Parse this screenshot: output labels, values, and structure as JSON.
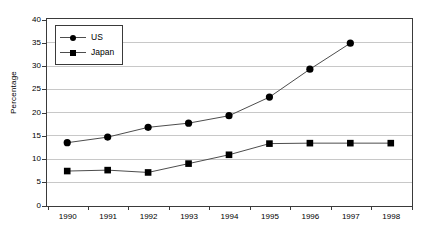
{
  "chart_data": {
    "type": "line",
    "title": "",
    "xlabel": "",
    "ylabel": "Percentage",
    "categories": [
      "1990",
      "1991",
      "1992",
      "1993",
      "1994",
      "1995",
      "1996",
      "1997",
      "1998"
    ],
    "ylim": [
      0,
      40
    ],
    "yticks": [
      0,
      5,
      10,
      15,
      20,
      25,
      30,
      35,
      40
    ],
    "ytick_labels": [
      "0",
      "5",
      "10",
      "15",
      "20",
      "25",
      "30",
      "35",
      "40"
    ],
    "grid": "horizontal",
    "legend_position": "top-left",
    "series": [
      {
        "name": "US",
        "marker": "circle",
        "color": "#000000",
        "x": [
          "1990",
          "1991",
          "1992",
          "1993",
          "1994",
          "1995",
          "1996",
          "1997"
        ],
        "values": [
          13.4,
          14.6,
          16.7,
          17.6,
          19.2,
          23.2,
          29.2,
          34.8
        ]
      },
      {
        "name": "Japan",
        "marker": "square",
        "color": "#000000",
        "x": [
          "1990",
          "1991",
          "1992",
          "1993",
          "1994",
          "1995",
          "1996",
          "1997",
          "1998"
        ],
        "values": [
          7.3,
          7.5,
          7.0,
          8.9,
          10.8,
          13.2,
          13.3,
          13.3,
          13.3
        ]
      }
    ]
  },
  "legend": {
    "items": [
      {
        "label": "US",
        "marker": "circle"
      },
      {
        "label": "Japan",
        "marker": "square"
      }
    ]
  },
  "colors": {
    "line": "#4d4d4d",
    "marker": "#000000",
    "gridline": "#c8c8c8",
    "axis": "#3a3a3a",
    "background": "#ffffff"
  }
}
